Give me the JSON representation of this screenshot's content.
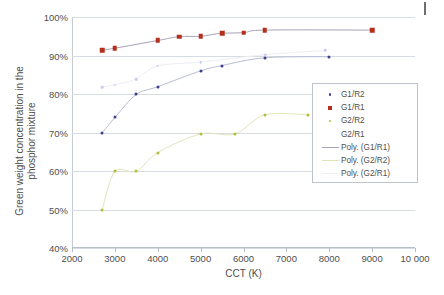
{
  "chart_data": {
    "type": "scatter",
    "title": "",
    "xlabel": "CCT (K)",
    "ylabel": "Green weight concentration in the phosphor mixture",
    "ylabel_line1": "Green weight concentration in the",
    "ylabel_line2": "phosphor mixture",
    "xlim": [
      2000,
      10000
    ],
    "ylim": [
      40,
      100
    ],
    "xticks": [
      2000,
      3000,
      4000,
      5000,
      6000,
      7000,
      8000,
      9000,
      10000
    ],
    "xticklabels": [
      "2000",
      "3000",
      "4000",
      "5000",
      "6000",
      "7000",
      "8000",
      "9000",
      "10 000"
    ],
    "yticks": [
      40,
      50,
      60,
      70,
      80,
      90,
      100
    ],
    "yticklabels": [
      "40%",
      "50%",
      "60%",
      "70%",
      "80%",
      "90%",
      "100%"
    ],
    "grid": "horizontal",
    "legend_position": "right-inside",
    "series": [
      {
        "name": "G1/R2",
        "marker": "circle",
        "color": "#3b3f8c",
        "points": [
          {
            "x": 2700,
            "y": 69.9
          },
          {
            "x": 3000,
            "y": 73.9
          },
          {
            "x": 3500,
            "y": 79.9
          },
          {
            "x": 4000,
            "y": 81.9
          },
          {
            "x": 5000,
            "y": 86.0
          },
          {
            "x": 5500,
            "y": 87.4
          },
          {
            "x": 6500,
            "y": 89.4
          },
          {
            "x": 8000,
            "y": 89.7
          }
        ]
      },
      {
        "name": "G1/R1",
        "marker": "square",
        "color": "#b4301d",
        "points": [
          {
            "x": 2700,
            "y": 91.4
          },
          {
            "x": 3000,
            "y": 91.9
          },
          {
            "x": 4000,
            "y": 93.9
          },
          {
            "x": 4500,
            "y": 94.9
          },
          {
            "x": 5000,
            "y": 95.0
          },
          {
            "x": 5500,
            "y": 95.8
          },
          {
            "x": 6000,
            "y": 95.9
          },
          {
            "x": 6500,
            "y": 96.6
          },
          {
            "x": 9000,
            "y": 96.6
          }
        ]
      },
      {
        "name": "G2/R2",
        "marker": "circle",
        "color": "#b3bd3a",
        "points": [
          {
            "x": 2700,
            "y": 49.8
          },
          {
            "x": 3000,
            "y": 59.9
          },
          {
            "x": 3500,
            "y": 59.9
          },
          {
            "x": 4000,
            "y": 64.8
          },
          {
            "x": 5000,
            "y": 69.6
          },
          {
            "x": 5800,
            "y": 69.6
          },
          {
            "x": 6500,
            "y": 74.6
          },
          {
            "x": 7500,
            "y": 74.6
          }
        ]
      },
      {
        "name": "G2/R1",
        "marker": "circle",
        "color": "#c8cce8",
        "points": [
          {
            "x": 2700,
            "y": 81.8
          },
          {
            "x": 3000,
            "y": 82.4
          },
          {
            "x": 3500,
            "y": 83.9
          },
          {
            "x": 4000,
            "y": 87.3
          },
          {
            "x": 5000,
            "y": 88.3
          },
          {
            "x": 6500,
            "y": 90.2
          },
          {
            "x": 7900,
            "y": 91.3
          }
        ]
      }
    ],
    "trendlines": [
      {
        "name": "Poly. (G1/R1)",
        "color": "#a8a2b8",
        "for": "G1/R1"
      },
      {
        "name": "Poly. (G2/R2)",
        "color": "#e2e4bd",
        "for": "G2/R2"
      },
      {
        "name": "Poly. (G2/R1)",
        "color": "#ededf4",
        "for": "G2/R1"
      },
      {
        "name": "Trend (G1/R2)",
        "color": "#b9bcd4",
        "for": "G1/R2"
      }
    ],
    "legend_entries": [
      {
        "label": "G1/R2",
        "key": "dot",
        "color": "#3b3f8c"
      },
      {
        "label": "G1/R1",
        "key": "square",
        "color": "#b4301d"
      },
      {
        "label": "G2/R2",
        "key": "dot",
        "color": "#b3bd3a"
      },
      {
        "label": "G2/R1",
        "key": "none",
        "color": "#e8eaf4"
      },
      {
        "label": "Poly. (G1/R1)",
        "key": "line",
        "color": "#a8a2b8"
      },
      {
        "label": "Poly. (G2/R2)",
        "key": "line",
        "color": "#dfe2b6"
      },
      {
        "label": "Poly. (G2/R1)",
        "key": "line",
        "color": "#eeeef5"
      }
    ]
  }
}
